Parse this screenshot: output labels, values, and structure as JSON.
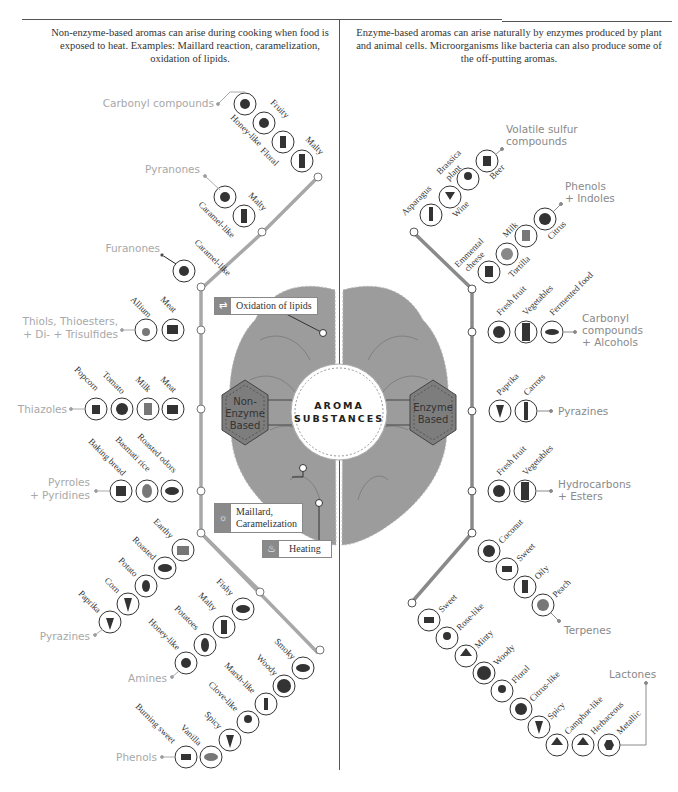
{
  "intro": {
    "left": "Non-enzyme-based aromas can arise during cooking when food is exposed to heat. Examples: Maillard reaction, caramelization, oxidation of lipids.",
    "right": "Enzyme-based aromas can arise naturally by enzymes produced by plant and animal cells. Microorganisms like bacteria can also produce some of the off-putting aromas."
  },
  "center": {
    "title_line1": "AROMA",
    "title_line2": "SUBSTANCES",
    "left_hex": [
      "Non-",
      "Enzyme",
      "Based"
    ],
    "right_hex": [
      "Enzyme",
      "Based"
    ]
  },
  "callouts": {
    "oxidation": "Oxidation of lipids",
    "maillard_1": "Maillard,",
    "maillard_2": "Caramelization",
    "heating": "Heating"
  },
  "colors": {
    "left_track": "#a8a8a8",
    "right_track": "#8a8a8a",
    "brain": "#9c9c9c",
    "hex": "#7d7d7d",
    "category_left": "#a8a8a8",
    "category_right": "#8a8a8a"
  },
  "left_groups": [
    {
      "category": "Carbonyl compounds",
      "sources": [
        "Honey-like",
        "Fruity",
        "Floral",
        "Malty"
      ]
    },
    {
      "category": "Pyranones",
      "sources": [
        "Caramel-like",
        "Malty"
      ]
    },
    {
      "category": "Furanones",
      "sources": [
        "Caramel-like"
      ]
    },
    {
      "category": "Thiols, Thioesters, + Di- + Trisulfides",
      "sources": [
        "Allium",
        "Meat"
      ]
    },
    {
      "category": "Thiazoles",
      "sources": [
        "Popcorn",
        "Tomato",
        "Milk",
        "Meat"
      ]
    },
    {
      "category": "Pyrroles + Pyridines",
      "sources": [
        "Baking bread",
        "Basmati rice",
        "Roasted odors"
      ]
    },
    {
      "category": "Pyrazines",
      "sources": [
        "Earthy",
        "Roasted",
        "Potato",
        "Corn",
        "Paprika"
      ]
    },
    {
      "category": "Amines",
      "sources": [
        "Fishy",
        "Malty",
        "Potatoes",
        "Honey-like"
      ]
    },
    {
      "category": "Phenols",
      "sources": [
        "Smoky",
        "Woody",
        "Marsh-like",
        "Clove-like",
        "Spicy",
        "Vanilla",
        "Burning sweet"
      ]
    }
  ],
  "right_groups": [
    {
      "category": "Volatile sulfur compounds",
      "sources": [
        "Asparagus",
        "Wine",
        "Brassica plant",
        "Beer"
      ]
    },
    {
      "category": "Phenols + Indoles",
      "sources": [
        "Emmental cheese",
        "Tortilla",
        "Milk",
        "Citrus"
      ]
    },
    {
      "category": "Carbonyl compounds + Alcohols",
      "sources": [
        "Fresh fruit",
        "Vegetables",
        "Fermented food"
      ]
    },
    {
      "category": "Pyrazines",
      "sources": [
        "Paprika",
        "Carrots"
      ]
    },
    {
      "category": "Hydrocarbons + Esters",
      "sources": [
        "Fresh fruit",
        "Vegetables"
      ]
    },
    {
      "category": "Terpenes",
      "sources": [
        "Coconut",
        "Sweet",
        "Oily",
        "Peach"
      ]
    },
    {
      "category": "Lactones",
      "sources": [
        "Sweet",
        "Rose-like",
        "Minty",
        "Woody",
        "Floral",
        "Citrus-like",
        "Spicy",
        "Camphor-like",
        "Herbaceous",
        "Metallic"
      ]
    }
  ]
}
